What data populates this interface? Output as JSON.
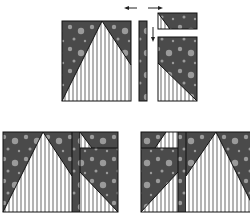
{
  "diagram": {
    "colors": {
      "dark_fabric": "#4a4a4a",
      "dot": "#9a9a9a",
      "stripe_light": "#ffffff",
      "stripe_dark": "#b4b4b4",
      "outline": "#111111",
      "background": "#ffffff"
    },
    "top": {
      "arrows": [
        "left-arrow",
        "right-arrow",
        "down-arrow"
      ],
      "pieces": [
        "large-triangle-unit",
        "narrow-strip",
        "small-corner-unit",
        "tall-corner-unit"
      ]
    },
    "bottom": {
      "assemblies": [
        "assembled-block-left",
        "assembled-block-right-mirrored"
      ]
    }
  }
}
